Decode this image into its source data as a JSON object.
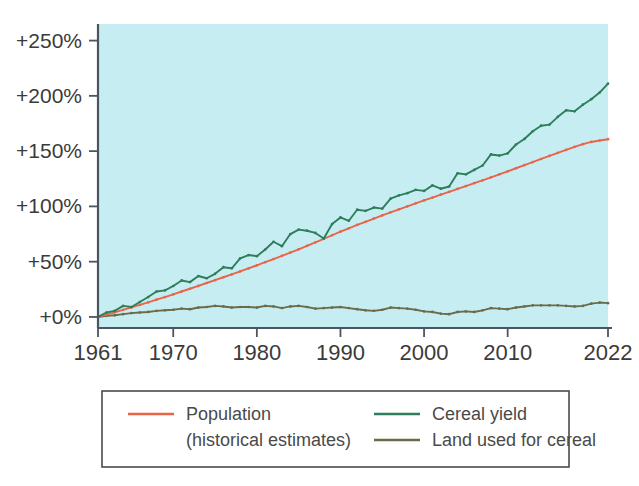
{
  "chart_data": {
    "type": "line",
    "title": "",
    "subtitle": "",
    "xlabel": "",
    "ylabel": "",
    "xlim": [
      1961,
      2022
    ],
    "ylim": [
      -10,
      265
    ],
    "grid": false,
    "plot_background_color": "#c6eef2",
    "axis_color": "#4a5560",
    "legend_position": "bottom",
    "y_ticks": [
      {
        "value": 0,
        "label": "+0%"
      },
      {
        "value": 50,
        "label": "+50%"
      },
      {
        "value": 100,
        "label": "+100%"
      },
      {
        "value": 150,
        "label": "+150%"
      },
      {
        "value": 200,
        "label": "+200%"
      },
      {
        "value": 250,
        "label": "+250%"
      }
    ],
    "x_ticks": [
      {
        "value": 1961,
        "label": "1961"
      },
      {
        "value": 1970,
        "label": "1970"
      },
      {
        "value": 1980,
        "label": "1980"
      },
      {
        "value": 1990,
        "label": "1990"
      },
      {
        "value": 2000,
        "label": "2000"
      },
      {
        "value": 2010,
        "label": "2010"
      },
      {
        "value": 2022,
        "label": "2022"
      }
    ],
    "x": [
      1961,
      1962,
      1963,
      1964,
      1965,
      1966,
      1967,
      1968,
      1969,
      1970,
      1971,
      1972,
      1973,
      1974,
      1975,
      1976,
      1977,
      1978,
      1979,
      1980,
      1981,
      1982,
      1983,
      1984,
      1985,
      1986,
      1987,
      1988,
      1989,
      1990,
      1991,
      1992,
      1993,
      1994,
      1995,
      1996,
      1997,
      1998,
      1999,
      2000,
      2001,
      2002,
      2003,
      2004,
      2005,
      2006,
      2007,
      2008,
      2009,
      2010,
      2011,
      2012,
      2013,
      2014,
      2015,
      2016,
      2017,
      2018,
      2019,
      2020,
      2021,
      2022
    ],
    "series": [
      {
        "name": "Population (historical estimates)",
        "legend_label": "Population",
        "legend_sublabel": "(historical estimates)",
        "color": "#e8654a",
        "markers": true,
        "values": [
          0,
          2.1,
          4.2,
          6.4,
          8.6,
          10.9,
          13.2,
          15.6,
          18.0,
          20.5,
          23.0,
          25.5,
          28.1,
          30.7,
          33.3,
          35.9,
          38.5,
          41.2,
          43.9,
          46.7,
          49.5,
          52.4,
          55.3,
          58.2,
          61.2,
          64.3,
          67.5,
          70.7,
          73.9,
          77.1,
          80.2,
          83.2,
          86.1,
          89.0,
          91.8,
          94.6,
          97.4,
          100.1,
          102.8,
          105.4,
          108.0,
          110.6,
          113.2,
          115.8,
          118.4,
          121.0,
          123.6,
          126.3,
          129.0,
          131.7,
          134.5,
          137.3,
          140.1,
          142.9,
          145.7,
          148.5,
          151.2,
          153.8,
          156.3,
          158.3,
          159.6,
          160.8
        ]
      },
      {
        "name": "Cereal yield",
        "legend_label": "Cereal yield",
        "color": "#2e7d5b",
        "markers": true,
        "values": [
          0,
          4.0,
          5.5,
          10.0,
          9.0,
          13.5,
          18.0,
          23.0,
          24.0,
          28.0,
          33.0,
          31.5,
          37.0,
          35.0,
          39.0,
          45.0,
          44.0,
          53.0,
          56.0,
          55.0,
          61.0,
          68.0,
          64.0,
          75.0,
          79.0,
          78.0,
          76.0,
          71.0,
          84.0,
          90.0,
          87.0,
          97.0,
          96.0,
          99.0,
          98.0,
          107.0,
          110.0,
          112.0,
          115.0,
          114.0,
          119.0,
          116.0,
          118.0,
          130.0,
          129.0,
          133.0,
          137.0,
          147.0,
          146.0,
          148.0,
          156.0,
          161.0,
          168.0,
          173.0,
          174.0,
          181.0,
          187.0,
          186.0,
          192.0,
          197.0,
          203.0,
          211.0
        ]
      },
      {
        "name": "Land used for cereal",
        "legend_label": "Land used for cereal",
        "color": "#6b6b4a",
        "markers": true,
        "values": [
          0,
          1.0,
          1.5,
          2.5,
          3.5,
          4.0,
          4.5,
          5.5,
          6.0,
          6.5,
          7.5,
          7.0,
          8.5,
          9.0,
          10.0,
          9.5,
          8.5,
          9.0,
          9.0,
          8.5,
          10.0,
          9.5,
          8.0,
          9.5,
          10.0,
          9.0,
          7.5,
          8.0,
          8.5,
          9.0,
          8.0,
          7.0,
          6.0,
          5.5,
          6.5,
          8.5,
          8.0,
          7.5,
          6.5,
          5.0,
          4.5,
          3.0,
          2.5,
          4.5,
          5.0,
          4.5,
          6.0,
          8.0,
          7.5,
          7.0,
          8.5,
          9.5,
          10.5,
          10.5,
          10.5,
          10.5,
          10.0,
          9.5,
          10.0,
          12.0,
          13.0,
          12.5
        ]
      }
    ]
  },
  "legend": {
    "entries": [
      {
        "label": "Population",
        "sublabel": "(historical estimates)",
        "color": "#e8654a"
      },
      {
        "label": "Cereal yield",
        "sublabel": "",
        "color": "#2e7d5b"
      },
      {
        "label": "Land used for cereal",
        "sublabel": "",
        "color": "#6b6b4a"
      }
    ]
  }
}
